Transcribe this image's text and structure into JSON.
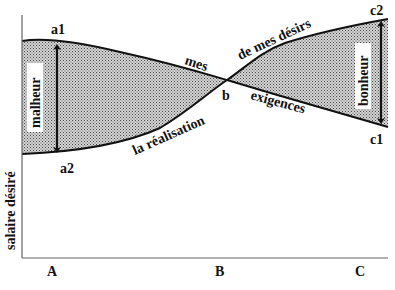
{
  "diagram": {
    "y_axis_label": "salaire désiré",
    "x_ticks": [
      "A",
      "B",
      "C"
    ],
    "points": {
      "a1": "a1",
      "a2": "a2",
      "b": "b",
      "c1": "c1",
      "c2": "c2"
    },
    "upper_curve_labels": [
      "mes",
      "exigences"
    ],
    "lower_curve_labels": [
      "la réalisation",
      "de mes désirs"
    ],
    "left_region_label": "malheur",
    "right_region_label": "bonheur",
    "colors": {
      "line": "#111111",
      "fill_pattern_dark": "#555555",
      "fill_pattern_light": "#d9d9d9",
      "background": "#ffffff",
      "axis": "#666666"
    }
  }
}
